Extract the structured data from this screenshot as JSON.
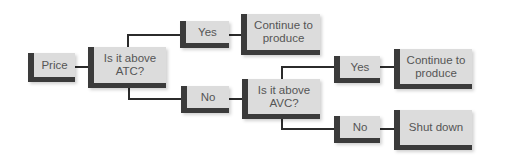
{
  "diagram": {
    "title": "",
    "type": "decision-tree",
    "nodes": {
      "price": {
        "label": "Price"
      },
      "q_atc": {
        "label": "Is it above ATC?"
      },
      "yes1": {
        "label": "Yes"
      },
      "no1": {
        "label": "No"
      },
      "continue1": {
        "label": "Continue to produce"
      },
      "q_avc": {
        "label": "Is it above AVC?"
      },
      "yes2": {
        "label": "Yes"
      },
      "no2": {
        "label": "No"
      },
      "continue2": {
        "label": "Continue to produce"
      },
      "shutdown": {
        "label": "Shut down"
      }
    },
    "edges": [
      [
        "price",
        "q_atc"
      ],
      [
        "q_atc",
        "yes1"
      ],
      [
        "yes1",
        "continue1"
      ],
      [
        "q_atc",
        "no1"
      ],
      [
        "no1",
        "q_avc"
      ],
      [
        "q_avc",
        "yes2"
      ],
      [
        "yes2",
        "continue2"
      ],
      [
        "q_avc",
        "no2"
      ],
      [
        "no2",
        "shutdown"
      ]
    ],
    "colors": {
      "box_fill": "#dcdcdc",
      "box_accent": "#3b3b3b",
      "text": "#555555",
      "connector": "#2b2b2b"
    }
  }
}
